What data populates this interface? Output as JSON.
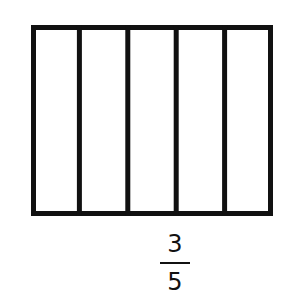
{
  "diagram": {
    "type": "fraction-bar-model",
    "parts": 5,
    "shaded_parts": 0,
    "stroke_color": "#111111",
    "fill_color": "#ffffff",
    "outer": {
      "x": 31,
      "y": 25,
      "width": 242,
      "height": 191
    },
    "stroke_width": 5
  },
  "fraction": {
    "numerator": "3",
    "denominator": "5"
  }
}
